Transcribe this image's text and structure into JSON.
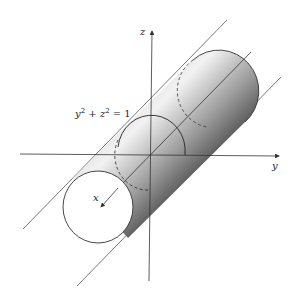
{
  "figure": {
    "equation": {
      "lhs_a": "y",
      "exp_a": "2",
      "plus": " + ",
      "lhs_b": "z",
      "exp_b": "2",
      "rhs": " = 1"
    },
    "axes": {
      "x_label": "x",
      "y_label": "y",
      "z_label": "z"
    },
    "colors": {
      "stroke": "#333333",
      "shade_light": "#e8e8e8",
      "shade_dark": "#111111",
      "background": "#ffffff"
    }
  }
}
